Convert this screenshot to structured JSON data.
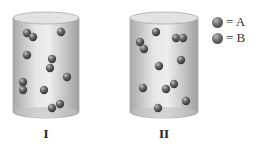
{
  "containers": [
    {
      "id": "I",
      "label": "I",
      "x": 13,
      "y": 12,
      "width": 66,
      "height": 106,
      "particles": [
        [
          27,
          33
        ],
        [
          33,
          37
        ],
        [
          61,
          32
        ],
        [
          27,
          55
        ],
        [
          52,
          59
        ],
        [
          50,
          68
        ],
        [
          67,
          77
        ],
        [
          23,
          82
        ],
        [
          23,
          90
        ],
        [
          44,
          90
        ],
        [
          60,
          104
        ],
        [
          52,
          108
        ]
      ]
    },
    {
      "id": "II",
      "label": "II",
      "x": 130,
      "y": 12,
      "width": 68,
      "height": 106,
      "particles": [
        [
          156,
          32
        ],
        [
          176,
          38
        ],
        [
          183,
          38
        ],
        [
          140,
          42
        ],
        [
          144,
          49
        ],
        [
          159,
          66
        ],
        [
          181,
          60
        ],
        [
          143,
          88
        ],
        [
          166,
          89
        ],
        [
          174,
          84
        ],
        [
          158,
          108
        ],
        [
          186,
          101
        ]
      ]
    }
  ],
  "legend": {
    "items": [
      {
        "symbol": "ball",
        "label": "= A"
      },
      {
        "symbol": "ball",
        "label": "= B"
      }
    ]
  },
  "colors": {
    "cylinder_fill": "#d6d6d6",
    "cylinder_edge": "#a8a8a8",
    "particle": "#555555",
    "text": "#222222"
  }
}
